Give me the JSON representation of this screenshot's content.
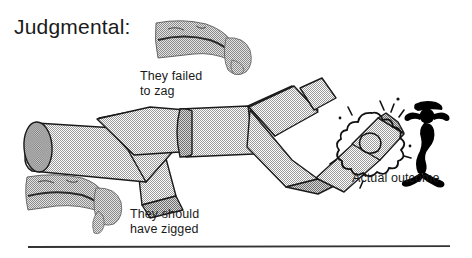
{
  "page": {
    "title": "Judgmental:",
    "background_color": "#ffffff",
    "ink_color": "#1a1a1a"
  },
  "captions": {
    "failed_to_zag": "They failed\nto zag",
    "should_have_zigged": "They should\nhave zigged",
    "actual_outcome": "Actual outcome"
  },
  "illustration": {
    "tube_fill_color": "#cbcbcb",
    "tube_outline_color": "#1a1a1a",
    "hand_fill_color": "#b4b4b4",
    "explosion_color": "#1a1a1a",
    "stick_figure_color": "#000000",
    "elements": [
      "zigzag-tube-path",
      "pointing-hand-upper",
      "pointing-hand-lower",
      "explosion-puff",
      "distressed-stick-figure",
      "bottom-rule"
    ]
  },
  "rule": {
    "color": "#333333",
    "x_start": 28,
    "x_end": 450,
    "y": 247
  }
}
